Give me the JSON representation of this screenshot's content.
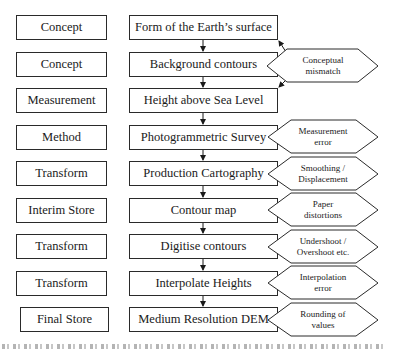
{
  "diagram": {
    "rows": [
      {
        "category": "Concept",
        "step": "Form of the Earth’s surface"
      },
      {
        "category": "Concept",
        "step": "Background contours"
      },
      {
        "category": "Measurement",
        "step": "Height above Sea Level"
      },
      {
        "category": "Method",
        "step": "Photogrammetric Survey"
      },
      {
        "category": "Transform",
        "step": "Production Cartography"
      },
      {
        "category": "Interim Store",
        "step": "Contour map"
      },
      {
        "category": "Transform",
        "step": "Digitise contours"
      },
      {
        "category": "Transform",
        "step": "Interpolate Heights"
      },
      {
        "category": "Final Store",
        "step": "Medium Resolution DEM"
      }
    ],
    "errors": [
      {
        "row": 1,
        "line1": "Conceptual",
        "line2": "mismatch",
        "points_to": "rows 0 and 2"
      },
      {
        "row": 3,
        "line1": "Measurement",
        "line2": "error"
      },
      {
        "row": 4,
        "line1": "Smoothing /",
        "line2": "Displacement"
      },
      {
        "row": 5,
        "line1": "Paper",
        "line2": "distortions"
      },
      {
        "row": 6,
        "line1": "Undershoot /",
        "line2": "Overshoot etc."
      },
      {
        "row": 7,
        "line1": "Interpolation",
        "line2": "error"
      },
      {
        "row": 8,
        "line1": "Rounding of",
        "line2": "values"
      }
    ],
    "colors": {
      "stroke": "#2a2a2a",
      "fill": "#ffffff",
      "text": "#1a1a1a"
    }
  }
}
